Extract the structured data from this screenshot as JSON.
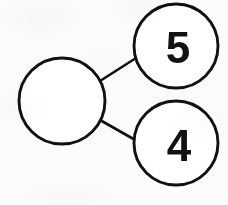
{
  "diagram": {
    "type": "number-bond",
    "background_color": "#fbfbfb",
    "stroke_color": "#111111",
    "text_color": "#121212",
    "whole": {
      "label": "",
      "value": null,
      "filled": false,
      "cx": 62,
      "cy": 101,
      "r": 43
    },
    "parts": [
      {
        "label": "5",
        "value": 5,
        "filled": true,
        "cx": 176,
        "cy": 46,
        "r": 42,
        "text_x": 178,
        "text_y": 47
      },
      {
        "label": "4",
        "value": 4,
        "filled": true,
        "cx": 176,
        "cy": 143,
        "r": 42,
        "text_x": 179,
        "text_y": 145
      }
    ],
    "connectors": [
      {
        "name": "whole-to-part-top",
        "x1": 100,
        "y1": 81,
        "x2": 136,
        "y2": 58
      },
      {
        "name": "whole-to-part-bottom",
        "x1": 100,
        "y1": 120,
        "x2": 137,
        "y2": 141
      }
    ]
  }
}
